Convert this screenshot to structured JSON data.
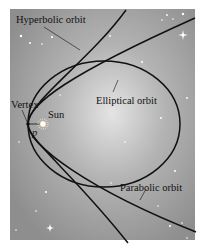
{
  "figure": {
    "background_color": "#9a9a9a",
    "glow_color": "#ffffff",
    "orbit_color": "#111111",
    "labels": {
      "hyperbolic": "Hyperbolic orbit",
      "elliptical": "Elliptical orbit",
      "parabolic": "Parabolic orbit",
      "vertex": "Vertex",
      "sun": "Sun",
      "point": "p"
    },
    "icons": {
      "sun": "sun-icon",
      "vertex": "vertex-point-icon",
      "stars": "star-icons"
    }
  }
}
